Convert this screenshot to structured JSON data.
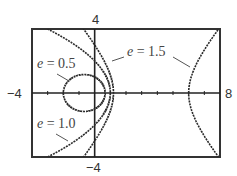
{
  "chart_data": {
    "type": "line",
    "title": "",
    "subtitle": "Conics r = e·p / (1 + e·cos θ) with p = 2 for several eccentricities",
    "xlabel": "",
    "ylabel": "",
    "xlim": [
      -4,
      8
    ],
    "ylim": [
      -4,
      4
    ],
    "grid": false,
    "legend": "inline labels with leader lines",
    "tick_labels": {
      "x_min": "−4",
      "x_max": "8",
      "y_max": "4",
      "y_min": "−4"
    },
    "tick_step": 1,
    "directrix_p": 2,
    "series": [
      {
        "name": "e = 0.5",
        "e": 0.5,
        "shape": "ellipse",
        "vertices_x": [
          -2,
          0.67
        ]
      },
      {
        "name": "e = 1.0",
        "e": 1.0,
        "shape": "parabola",
        "vertices_x": [
          1
        ]
      },
      {
        "name": "e = 1.5",
        "e": 1.5,
        "shape": "hyperbola",
        "vertices_x": [
          1.2,
          6
        ]
      }
    ]
  },
  "labels": {
    "e05": {
      "var": "e",
      "eq": " = 0.5"
    },
    "e10": {
      "var": "e",
      "eq": " = 1.0"
    },
    "e15": {
      "var": "e",
      "eq": " = 1.5"
    }
  },
  "axis_labels": {
    "x_min": "−4",
    "x_max": "8",
    "y_max": "4",
    "y_min": "−4"
  },
  "colors": {
    "frame": "#333333",
    "axis": "#222222",
    "curve": "#2a2a2a",
    "text": "#333333"
  }
}
